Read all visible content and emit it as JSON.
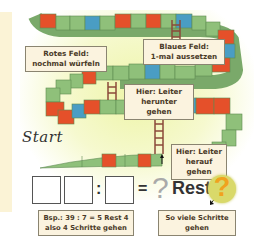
{
  "labels": {
    "red_field": {
      "title": "Rotes Feld:",
      "text": "nochmal würfeln"
    },
    "blue_field": {
      "title": "Blaues Feld:",
      "text": "1-mal aussetzen"
    },
    "ladder_down": {
      "title": "Hier: Leiter",
      "text": "herunter gehen"
    },
    "ladder_up": {
      "title": "Hier: Leiter",
      "text": "herauf gehen"
    },
    "example": {
      "line1": "Bsp.: 39 : 7 = 5 Rest 4",
      "line2": "also 4 Schritte gehen"
    },
    "steps": {
      "line1": "So viele Schritte",
      "line2": "gehen"
    }
  },
  "start_label": "Start",
  "equation": {
    "colon": ":",
    "equals": "=",
    "quotient_placeholder": "?",
    "rest_label": "Rest",
    "remainder_placeholder": "?"
  },
  "colors": {
    "green_field": "#8fc07a",
    "red_field": "#e5502a",
    "blue_field": "#4a9dc4",
    "ladder": "#8b4a3a",
    "label_bg": "#fbf3df",
    "remainder_circle": "#d9d96a",
    "remainder_question": "#f0a21e"
  }
}
